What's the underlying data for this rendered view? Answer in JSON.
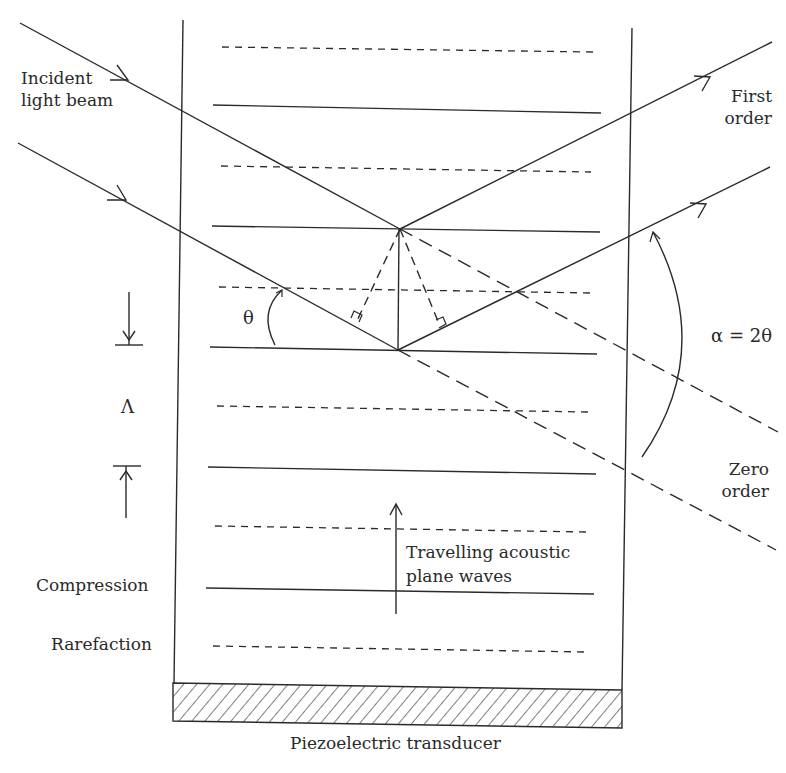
{
  "figure": {
    "labels": {
      "incident_line1": "Incident",
      "incident_line2": "light beam",
      "first_order_line1": "First",
      "first_order_line2": "order",
      "zero_order_line1": "Zero",
      "zero_order_line2": "order",
      "alpha": "α = 2θ",
      "theta": "θ",
      "wavelength": "Λ",
      "compression": "Compression",
      "rarefaction": "Rarefaction",
      "travelling_line1": "Travelling acoustic",
      "travelling_line2": "plane waves",
      "transducer": "Piezoelectric transducer"
    },
    "colors": {
      "ink": "#2a2a2a",
      "background": "#ffffff"
    },
    "wavefronts": {
      "compression_count": 5,
      "rarefaction_count": 6
    }
  }
}
